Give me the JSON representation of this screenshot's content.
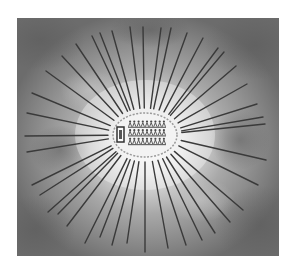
{
  "artwork": {
    "frame": {
      "x": 17,
      "y": 18,
      "width": 262,
      "height": 238
    },
    "center": {
      "x": 145,
      "y": 135
    },
    "colors": {
      "page": "#ffffff",
      "sky_dark": "#6e6e6e",
      "sky_mid": "#9a9a9a",
      "glow": "#f4f4f4",
      "ray": "#3a3a3a",
      "oval_fill": "#f2f2f2",
      "oval_edge": "#8a8a8a",
      "figure": "#4a4a4a"
    },
    "rays": [
      [
        130,
        27
      ],
      [
        143,
        27
      ],
      [
        161,
        28
      ],
      [
        171,
        28
      ],
      [
        187,
        33
      ],
      [
        203,
        38
      ],
      [
        218,
        48
      ],
      [
        224,
        52
      ],
      [
        236,
        66
      ],
      [
        247,
        84
      ],
      [
        257,
        104
      ],
      [
        263,
        117
      ],
      [
        265,
        124
      ],
      [
        266,
        160
      ],
      [
        258,
        185
      ],
      [
        243,
        210
      ],
      [
        230,
        222
      ],
      [
        215,
        233
      ],
      [
        202,
        240
      ],
      [
        186,
        245
      ],
      [
        168,
        248
      ],
      [
        145,
        252
      ],
      [
        127,
        243
      ],
      [
        112,
        245
      ],
      [
        100,
        237
      ],
      [
        85,
        243
      ],
      [
        67,
        226
      ],
      [
        58,
        214
      ],
      [
        48,
        212
      ],
      [
        40,
        195
      ],
      [
        32,
        185
      ],
      [
        27,
        152
      ],
      [
        25,
        136
      ],
      [
        27,
        113
      ],
      [
        32,
        93
      ],
      [
        46,
        71
      ],
      [
        62,
        56
      ],
      [
        76,
        44
      ],
      [
        92,
        36
      ],
      [
        100,
        33
      ],
      [
        112,
        31
      ]
    ],
    "inner_oval": {
      "cx": 145,
      "cy": 135,
      "rx": 32,
      "ry": 22
    },
    "framed_figure": {
      "x": 117,
      "y": 127,
      "width": 7,
      "height": 15
    },
    "figure_rows": 3,
    "figures_per_row": 9,
    "figures_area": {
      "x": 128,
      "y": 120,
      "width": 38,
      "height": 26
    }
  }
}
